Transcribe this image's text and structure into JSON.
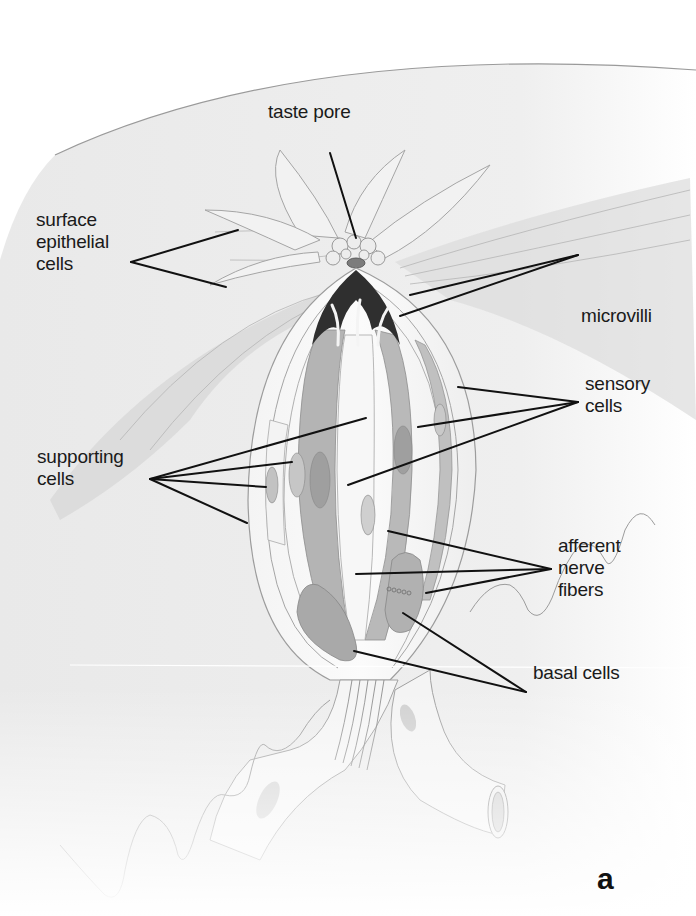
{
  "figure": {
    "panel_letter": "a",
    "colors": {
      "background": "#ffffff",
      "tissue": "#ececec",
      "tissue_dark": "#cfcfcf",
      "cell_light": "#f6f6f6",
      "cell_mid": "#b9b9b9",
      "cell_dark": "#8e8e8e",
      "microvilli": "#2e2e2e",
      "leader_line": "#111111",
      "text": "#1a1a1a"
    }
  },
  "labels": [
    {
      "id": "taste-pore",
      "text": "taste pore",
      "x": 268,
      "y": 119,
      "leaders": [
        [
          330,
          153,
          356,
          238
        ]
      ]
    },
    {
      "id": "surface-epithelial-cells",
      "text": "surface\nepithelial\ncells",
      "x": 36,
      "y": 227,
      "leaders": [
        [
          131,
          262,
          238,
          230
        ],
        [
          131,
          262,
          226,
          287
        ]
      ]
    },
    {
      "id": "microvilli",
      "text": "microvilli",
      "x": 581,
      "y": 323,
      "leaders": [
        [
          578,
          255,
          410,
          295
        ],
        [
          578,
          255,
          400,
          316
        ]
      ]
    },
    {
      "id": "sensory-cells",
      "text": "sensory\ncells",
      "x": 585,
      "y": 391,
      "leaders": [
        [
          578,
          402,
          458,
          387
        ],
        [
          578,
          402,
          418,
          427
        ],
        [
          578,
          402,
          348,
          485
        ]
      ]
    },
    {
      "id": "supporting-cells",
      "text": "supporting\ncells",
      "x": 37,
      "y": 464,
      "leaders": [
        [
          150,
          479,
          366,
          418
        ],
        [
          150,
          479,
          292,
          462
        ],
        [
          150,
          479,
          266,
          487
        ],
        [
          150,
          479,
          247,
          523
        ]
      ]
    },
    {
      "id": "afferent-nerve-fibers",
      "text": "afferent\nnerve\nfibers",
      "x": 558,
      "y": 553,
      "leaders": [
        [
          551,
          569,
          388,
          531
        ],
        [
          551,
          569,
          356,
          574
        ],
        [
          551,
          569,
          426,
          593
        ]
      ]
    },
    {
      "id": "basal-cells",
      "text": "basal cells",
      "x": 533,
      "y": 680,
      "leaders": [
        [
          526,
          692,
          403,
          613
        ],
        [
          526,
          692,
          354,
          651
        ]
      ]
    }
  ]
}
